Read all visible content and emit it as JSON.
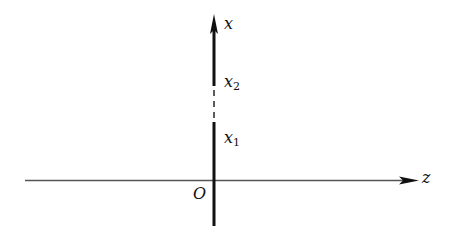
{
  "diagram": {
    "axes": {
      "vertical": {
        "label": "x"
      },
      "horizontal": {
        "label": "z"
      },
      "origin": {
        "label": "O"
      }
    },
    "points": [
      {
        "name": "x2",
        "base": "x",
        "sub": "2"
      },
      {
        "name": "x1",
        "base": "x",
        "sub": "1"
      }
    ],
    "colors": {
      "line": "#111111",
      "thin_line": "#555555"
    }
  }
}
